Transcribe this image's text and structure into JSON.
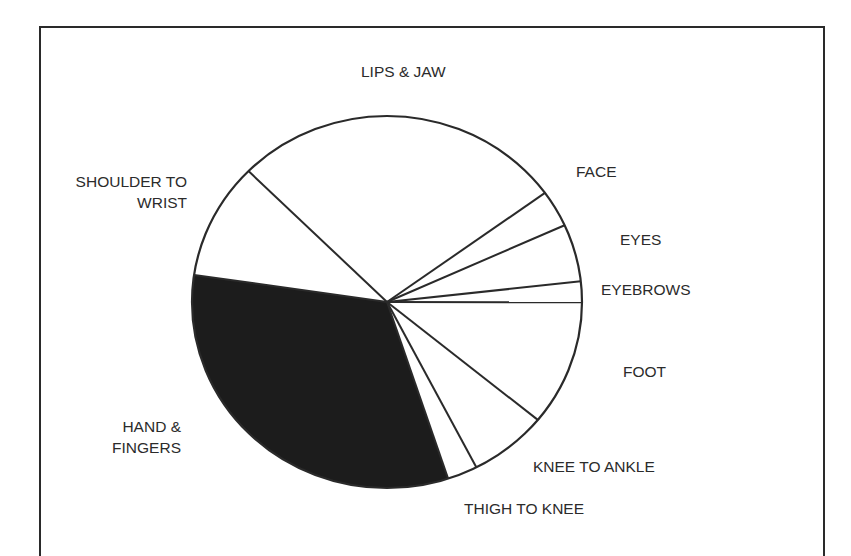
{
  "chart_data": {
    "type": "pie",
    "title": "",
    "start_angle_deg": 35.9,
    "direction": "counterclockwise",
    "center": [
      387,
      302
    ],
    "radius_x": 195,
    "radius_y": 186,
    "categories": [
      "LIPS & JAW",
      "SHOULDER TO WRIST",
      "HAND & FINGERS",
      "THIGH TO KNEE",
      "KNEE TO ANKLE",
      "FOOT",
      "EYEBROWS",
      "EYES",
      "FACE"
    ],
    "values": [
      27.6,
      10.1,
      32.4,
      2.5,
      6.5,
      10.9,
      1.8,
      5.0,
      3.2
    ],
    "unit": "% of circle (estimated from slice angles)",
    "highlighted": "HAND & FINGERS",
    "fill_colors": [
      "#ffffff",
      "#ffffff",
      "#1c1c1c",
      "#ffffff",
      "#ffffff",
      "#ffffff",
      "#ffffff",
      "#ffffff",
      "#ffffff"
    ],
    "stroke_color": "#2a2a2a",
    "legend": "none (direct labels)"
  },
  "labels": {
    "lips_jaw": "LIPS & JAW",
    "face": "FACE",
    "eyes": "EYES",
    "eyebrows": "EYEBROWS",
    "foot": "FOOT",
    "knee_to_ankle": "KNEE TO ANKLE",
    "thigh_to_knee": "THIGH TO KNEE",
    "hand_fingers_line1": "HAND &",
    "hand_fingers_line2": "FINGERS",
    "shoulder_wrist_line1": "SHOULDER TO",
    "shoulder_wrist_line2": "WRIST"
  }
}
